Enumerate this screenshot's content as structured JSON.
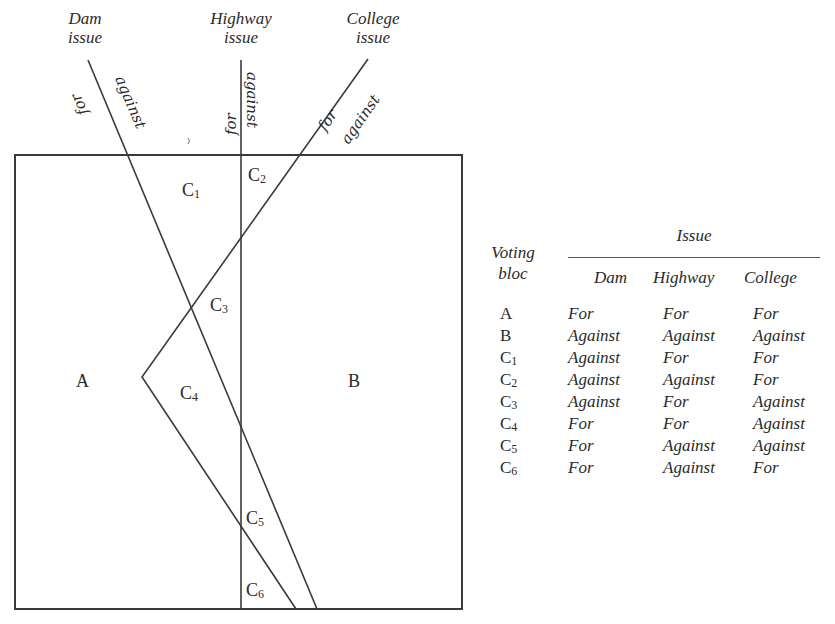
{
  "diagram": {
    "axes": [
      {
        "id": "dam",
        "title_line1": "Dam",
        "title_line2": "issue",
        "for_label": "for",
        "against_label": "against"
      },
      {
        "id": "highway",
        "title_line1": "Highway",
        "title_line2": "issue",
        "for_label": "for",
        "against_label": "against"
      },
      {
        "id": "college",
        "title_line1": "College",
        "title_line2": "issue",
        "for_label": "for",
        "against_label": "against"
      }
    ],
    "regions": {
      "A": "A",
      "B": "B",
      "C1": {
        "base": "C",
        "sub": "1"
      },
      "C2": {
        "base": "C",
        "sub": "2"
      },
      "C3": {
        "base": "C",
        "sub": "3"
      },
      "C4": {
        "base": "C",
        "sub": "4"
      },
      "C5": {
        "base": "C",
        "sub": "5"
      },
      "C6": {
        "base": "C",
        "sub": "6"
      }
    }
  },
  "table": {
    "header": {
      "bloc_line1": "Voting",
      "bloc_line2": "bloc",
      "issue": "Issue",
      "columns": [
        "Dam",
        "Highway",
        "College"
      ]
    },
    "rows": [
      {
        "bloc": "A",
        "sub": "",
        "dam": "For",
        "highway": "For",
        "college": "For"
      },
      {
        "bloc": "B",
        "sub": "",
        "dam": "Against",
        "highway": "Against",
        "college": "Against"
      },
      {
        "bloc": "C",
        "sub": "1",
        "dam": "Against",
        "highway": "For",
        "college": "For"
      },
      {
        "bloc": "C",
        "sub": "2",
        "dam": "Against",
        "highway": "Against",
        "college": "For"
      },
      {
        "bloc": "C",
        "sub": "3",
        "dam": "Against",
        "highway": "For",
        "college": "Against"
      },
      {
        "bloc": "C",
        "sub": "4",
        "dam": "For",
        "highway": "For",
        "college": "Against"
      },
      {
        "bloc": "C",
        "sub": "5",
        "dam": "For",
        "highway": "Against",
        "college": "Against"
      },
      {
        "bloc": "C",
        "sub": "6",
        "dam": "For",
        "highway": "Against",
        "college": "For"
      }
    ]
  }
}
